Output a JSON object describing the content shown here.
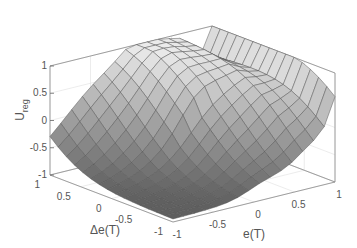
{
  "chart_data": {
    "type": "surface3d",
    "title": "",
    "xlabel": "e(T)",
    "ylabel": "Δe(T)",
    "zlabel": "U",
    "zlabel_subscript": "reg",
    "xlim": [
      -1,
      1
    ],
    "ylim": [
      -1,
      1
    ],
    "zlim": [
      -1,
      1
    ],
    "x_ticks": [
      "-1",
      "-0.5",
      "0",
      "0.5",
      "1"
    ],
    "y_ticks": [
      "1",
      "0.5",
      "0",
      "-0.5",
      "-1"
    ],
    "z_ticks": [
      "1",
      "0.5",
      "0",
      "-0.5",
      "-1"
    ],
    "grid": true,
    "colormap": "gray",
    "mesh": "15x15"
  },
  "axis_labels": {
    "z": "U",
    "z_sub": "reg",
    "y": "Δe(T)",
    "x": "e(T)"
  }
}
